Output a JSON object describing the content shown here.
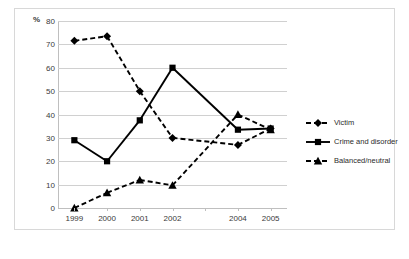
{
  "axis_unit_label": "%",
  "legend": {
    "items": [
      {
        "label": "Victim",
        "marker": "diamond-marker",
        "style": "dashed",
        "color": "#000000"
      },
      {
        "label": "Crime and disorder",
        "marker": "square-marker",
        "style": "solid",
        "color": "#000000"
      },
      {
        "label": "Balanced/neutral",
        "marker": "triangle-marker",
        "style": "dashed",
        "color": "#000000"
      }
    ]
  },
  "chart_data": {
    "type": "line",
    "title": "",
    "xlabel": "",
    "ylabel": "%",
    "ylim": [
      0,
      80
    ],
    "ytick_step": 10,
    "yticks": [
      0,
      10,
      20,
      30,
      40,
      50,
      60,
      70,
      80
    ],
    "categories": [
      "1999",
      "2000",
      "2001",
      "2002",
      "",
      "2004",
      "2005"
    ],
    "tick_positions": [
      "1999",
      "2000",
      "2001",
      "2002",
      "2003",
      "2004",
      "2005"
    ],
    "grid": true,
    "legend_position": "right",
    "series": [
      {
        "name": "Victim",
        "marker": "diamond",
        "line_style": "dashed",
        "color": "#000000",
        "values": [
          71.5,
          73.5,
          50,
          30,
          null,
          27,
          34
        ]
      },
      {
        "name": "Crime and disorder",
        "marker": "square",
        "line_style": "solid",
        "color": "#000000",
        "values": [
          29,
          20,
          37.5,
          60,
          null,
          33.5,
          34
        ]
      },
      {
        "name": "Balanced/neutral",
        "marker": "triangle",
        "line_style": "dashed",
        "color": "#000000",
        "values": [
          0,
          6.5,
          12,
          9.7,
          null,
          40,
          33.5
        ]
      }
    ]
  }
}
